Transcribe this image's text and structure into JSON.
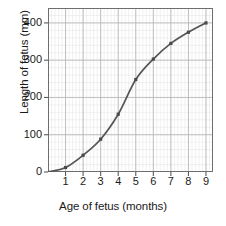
{
  "chart_data": {
    "type": "line",
    "title": "",
    "xlabel": "Age of fetus (months)",
    "ylabel": "Length of fetus (mm)",
    "x": [
      0,
      1,
      2,
      3,
      4,
      5,
      6,
      7,
      8,
      9
    ],
    "values": [
      0,
      12,
      45,
      88,
      155,
      248,
      303,
      345,
      375,
      400
    ],
    "series": [
      {
        "name": "Length of fetus",
        "values": [
          0,
          12,
          45,
          88,
          155,
          248,
          303,
          345,
          375,
          400
        ]
      }
    ],
    "xlim": [
      0,
      9.4
    ],
    "ylim": [
      0,
      440
    ],
    "x_ticks": [
      1,
      2,
      3,
      4,
      5,
      6,
      7,
      8,
      9
    ],
    "x_tick_labels": [
      "1",
      "2",
      "3",
      "4",
      "5",
      "6",
      "7",
      "8",
      "9"
    ],
    "y_ticks": [
      0,
      100,
      200,
      300,
      400
    ],
    "y_tick_labels": [
      "0",
      "100",
      "200",
      "300",
      "400"
    ],
    "grid": true,
    "minor_grid": true,
    "minor_divisions": 5,
    "legend": false,
    "legend_position": "none",
    "marker": "square",
    "line_color": "#555555",
    "marker_color": "#4a4a4a",
    "major_grid_color": "#b9b9b9",
    "minor_grid_color": "#e2e2e2",
    "axis_color": "#595959",
    "background_color": "#ffffff",
    "text_color": "#1a1a1a"
  }
}
